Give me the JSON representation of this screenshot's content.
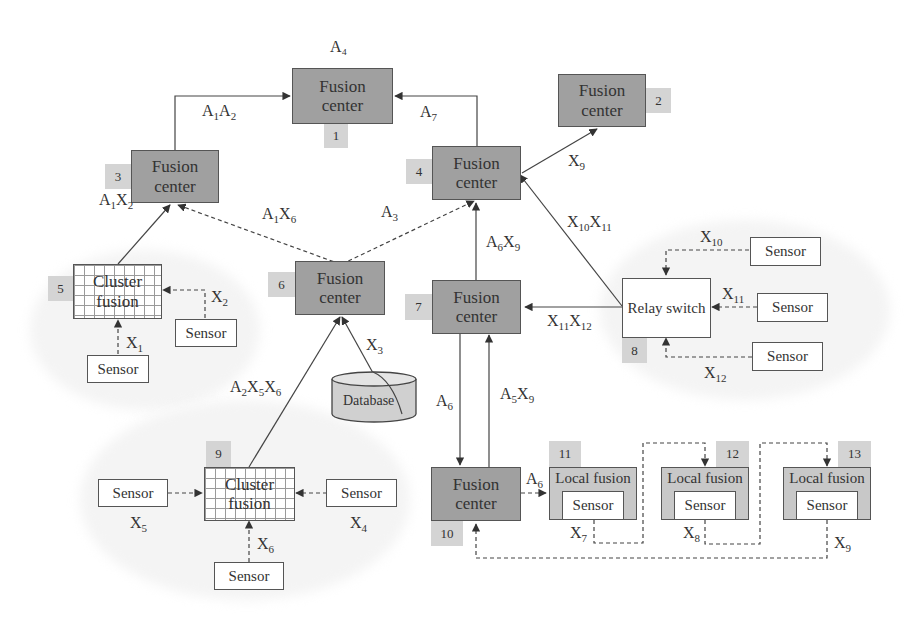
{
  "diagram": {
    "nodes": {
      "n1": {
        "number": "1",
        "type": "fusion-center",
        "label_line1": "Fusion",
        "label_line2": "center",
        "top_label": "A₄"
      },
      "n2": {
        "number": "2",
        "type": "fusion-center",
        "label_line1": "Fusion",
        "label_line2": "center"
      },
      "n3": {
        "number": "3",
        "type": "fusion-center",
        "label_line1": "Fusion",
        "label_line2": "center"
      },
      "n4": {
        "number": "4",
        "type": "fusion-center",
        "label_line1": "Fusion",
        "label_line2": "center"
      },
      "n5": {
        "number": "5",
        "type": "cluster-fusion",
        "label_line1": "Cluster",
        "label_line2": "fusion"
      },
      "n6": {
        "number": "6",
        "type": "fusion-center",
        "label_line1": "Fusion",
        "label_line2": "center"
      },
      "n7": {
        "number": "7",
        "type": "fusion-center",
        "label_line1": "Fusion",
        "label_line2": "center"
      },
      "n8": {
        "number": "8",
        "type": "relay-switch",
        "label": "Relay switch"
      },
      "n9": {
        "number": "9",
        "type": "cluster-fusion",
        "label_line1": "Cluster",
        "label_line2": "fusion"
      },
      "n10": {
        "number": "10",
        "type": "fusion-center",
        "label_line1": "Fusion",
        "label_line2": "center"
      },
      "n11": {
        "number": "11",
        "type": "local-fusion",
        "label": "Local fusion",
        "inner": "Sensor"
      },
      "n12": {
        "number": "12",
        "type": "local-fusion",
        "label": "Local fusion",
        "inner": "Sensor"
      },
      "n13": {
        "number": "13",
        "type": "local-fusion",
        "label": "Local fusion",
        "inner": "Sensor"
      }
    },
    "sensor_label": "Sensor",
    "database_label": "Database",
    "edge_labels": {
      "a1a2": {
        "base1": "A",
        "sub1": "1",
        "base2": "A",
        "sub2": "2"
      },
      "a7": {
        "base": "A",
        "sub": "7"
      },
      "x9_top": {
        "base": "X",
        "sub": "9"
      },
      "a1x2": {
        "base1": "A",
        "sub1": "1",
        "base2": "X",
        "sub2": "2"
      },
      "a1x6": {
        "base1": "A",
        "sub1": "1",
        "base2": "X",
        "sub2": "6"
      },
      "a3": {
        "base": "A",
        "sub": "3"
      },
      "x10x11": {
        "base1": "X",
        "sub1": "10",
        "base2": "X",
        "sub2": "11"
      },
      "a6x9": {
        "base1": "A",
        "sub1": "6",
        "base2": "X",
        "sub2": "9"
      },
      "x10": {
        "base": "X",
        "sub": "10"
      },
      "x11": {
        "base": "X",
        "sub": "11"
      },
      "x11x12": {
        "base1": "X",
        "sub1": "11",
        "base2": "X",
        "sub2": "12"
      },
      "x12": {
        "base": "X",
        "sub": "12"
      },
      "x2": {
        "base": "X",
        "sub": "2"
      },
      "x1": {
        "base": "X",
        "sub": "1"
      },
      "x3": {
        "base": "X",
        "sub": "3"
      },
      "a2x5x6": {
        "base1": "A",
        "sub1": "2",
        "base2": "X",
        "sub2": "5",
        "base3": "X",
        "sub3": "6"
      },
      "a6_down": {
        "base": "A",
        "sub": "6"
      },
      "a5x9": {
        "base1": "A",
        "sub1": "5",
        "base2": "X",
        "sub2": "9"
      },
      "a6_right": {
        "base": "A",
        "sub": "6"
      },
      "x5": {
        "base": "X",
        "sub": "5"
      },
      "x4": {
        "base": "X",
        "sub": "4"
      },
      "x6": {
        "base": "X",
        "sub": "6"
      },
      "x7": {
        "base": "X",
        "sub": "7"
      },
      "x8": {
        "base": "X",
        "sub": "8"
      },
      "x9_bottom": {
        "base": "X",
        "sub": "9"
      }
    },
    "colors": {
      "fusion_center_fill": "#a0a0a0",
      "number_tag_fill": "#d4d4d4",
      "local_fusion_fill": "#c8c8c8",
      "database_fill": "#d0d0d0",
      "line": "#444444"
    }
  }
}
